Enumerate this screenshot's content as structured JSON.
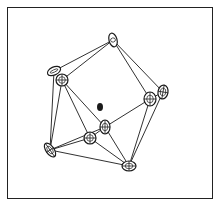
{
  "diagram": {
    "type": "polyhedral-cluster",
    "stroke_color": "#1a1a1a",
    "background": "#ffffff",
    "nodes": [
      {
        "id": "A",
        "x": 113,
        "y": 40,
        "rx": 4,
        "ry": 7,
        "rot": -15,
        "style": "ellipse"
      },
      {
        "id": "B",
        "x": 54,
        "y": 71,
        "rx": 7,
        "ry": 4,
        "rot": -25,
        "style": "ellipse"
      },
      {
        "id": "C",
        "x": 62,
        "y": 80,
        "rx": 6,
        "ry": 6,
        "rot": 0,
        "style": "octant"
      },
      {
        "id": "D",
        "x": 150,
        "y": 99,
        "rx": 6,
        "ry": 7,
        "rot": 0,
        "style": "octant"
      },
      {
        "id": "E",
        "x": 163,
        "y": 92,
        "rx": 5,
        "ry": 7,
        "rot": 10,
        "style": "octant"
      },
      {
        "id": "F",
        "x": 100,
        "y": 107,
        "rx": 3,
        "ry": 4,
        "rot": 0,
        "style": "filled"
      },
      {
        "id": "G",
        "x": 105,
        "y": 127,
        "rx": 5,
        "ry": 7,
        "rot": 0,
        "style": "octant"
      },
      {
        "id": "H",
        "x": 90,
        "y": 138,
        "rx": 6,
        "ry": 6,
        "rot": 0,
        "style": "octant"
      },
      {
        "id": "I",
        "x": 50,
        "y": 150,
        "rx": 4,
        "ry": 8,
        "rot": -35,
        "style": "octant"
      },
      {
        "id": "J",
        "x": 129,
        "y": 166,
        "rx": 7,
        "ry": 5,
        "rot": 0,
        "style": "octant"
      }
    ],
    "edges": [
      [
        "A",
        "B"
      ],
      [
        "A",
        "C"
      ],
      [
        "A",
        "D"
      ],
      [
        "A",
        "E"
      ],
      [
        "B",
        "I"
      ],
      [
        "C",
        "I"
      ],
      [
        "C",
        "H"
      ],
      [
        "C",
        "G"
      ],
      [
        "D",
        "E"
      ],
      [
        "D",
        "G"
      ],
      [
        "D",
        "J"
      ],
      [
        "E",
        "J"
      ],
      [
        "G",
        "H"
      ],
      [
        "G",
        "J"
      ],
      [
        "H",
        "I"
      ],
      [
        "H",
        "J"
      ],
      [
        "I",
        "J"
      ],
      [
        "I",
        "G"
      ]
    ]
  }
}
